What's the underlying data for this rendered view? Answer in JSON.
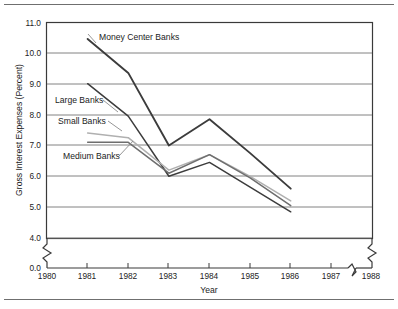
{
  "chart_data": {
    "type": "line",
    "title": "",
    "xlabel": "Year",
    "ylabel": "Gross Interest Expenses (Percent)",
    "x": [
      1981,
      1982,
      1983,
      1984,
      1985,
      1986
    ],
    "xtick_labels": [
      "1980",
      "1981",
      "1982",
      "1983",
      "1984",
      "1985",
      "1986",
      "1987",
      "1988"
    ],
    "xlim": [
      1980,
      1988
    ],
    "ytick_labels": [
      "0.0",
      "4.0",
      "5.0",
      "6.0",
      "7.0",
      "8.0",
      "9.0",
      "10.0",
      "11.0"
    ],
    "ylim": [
      4.0,
      11.0
    ],
    "y_axis_break": true,
    "x_axis_breaks": 2,
    "grid": "horizontal",
    "legend_position": "inline-annotations",
    "series": [
      {
        "name": "Money Center Banks",
        "color": "#3c3c3c",
        "width": 1.9,
        "values": [
          10.45,
          9.35,
          7.0,
          7.85,
          6.75,
          5.6
        ]
      },
      {
        "name": "Large Banks",
        "color": "#3c3c3c",
        "width": 1.5,
        "values": [
          9.0,
          7.95,
          6.0,
          6.45,
          5.65,
          4.85
        ]
      },
      {
        "name": "Small Banks",
        "color": "#b0b0b0",
        "width": 1.5,
        "values": [
          7.4,
          7.25,
          6.2,
          6.7,
          6.0,
          5.2
        ]
      },
      {
        "name": "Medium Banks",
        "color": "#6e6e6e",
        "width": 1.5,
        "values": [
          7.1,
          7.1,
          6.1,
          6.7,
          5.95,
          5.05
        ]
      }
    ],
    "annotations": [
      {
        "text": "Money Center Banks",
        "x": 99,
        "y": 40
      },
      {
        "text": "Large Banks",
        "x": 55,
        "y": 103
      },
      {
        "text": "Small Banks",
        "x": 58,
        "y": 124
      },
      {
        "text": "Medium Banks",
        "x": 63,
        "y": 159
      }
    ]
  }
}
